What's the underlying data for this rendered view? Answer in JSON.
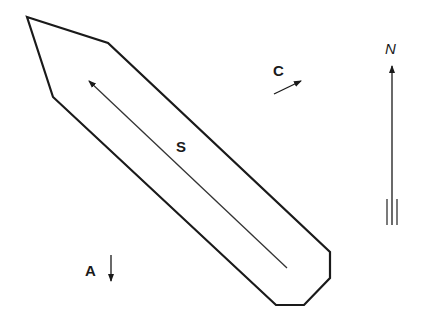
{
  "diagram": {
    "labels": {
      "s": "S",
      "c": "C",
      "a": "A",
      "n": "N"
    },
    "colors": {
      "stroke": "#1a1a1a",
      "background": "#ffffff"
    }
  }
}
